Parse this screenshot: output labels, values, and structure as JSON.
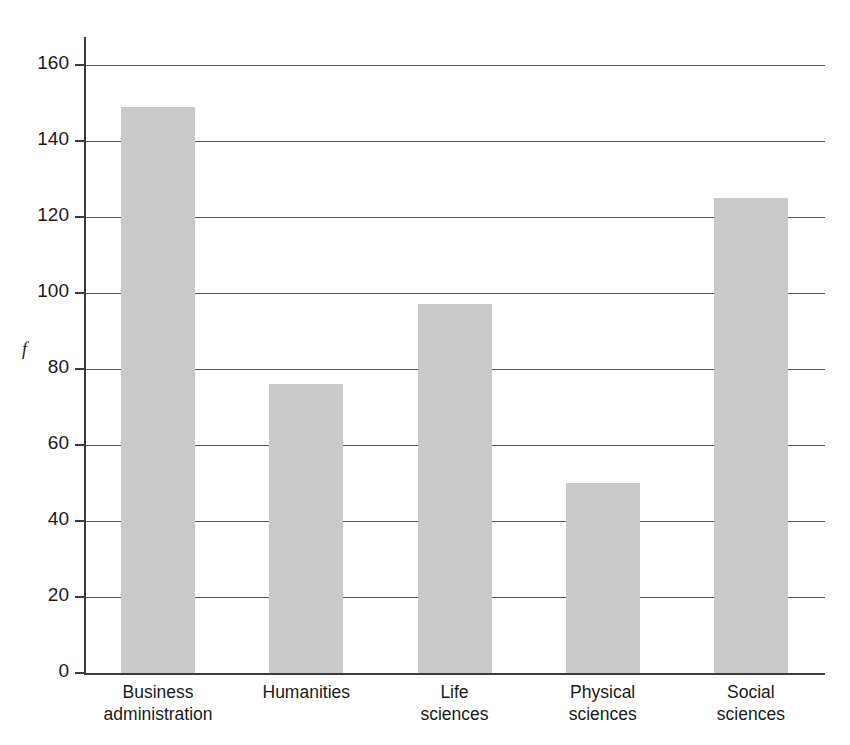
{
  "chart_data": {
    "type": "bar",
    "title": "",
    "xlabel": "",
    "ylabel": "f",
    "categories": [
      "Business\nadministration",
      "Humanities",
      "Life\nsciences",
      "Physical\nsciences",
      "Social\nsciences"
    ],
    "values": [
      149,
      76,
      97,
      50,
      125
    ],
    "ylim": [
      0,
      160
    ],
    "ytick_labels": [
      "0",
      "20",
      "40",
      "60",
      "80",
      "100",
      "120",
      "140",
      "160"
    ],
    "ytick_values": [
      0,
      20,
      40,
      60,
      80,
      100,
      120,
      140,
      160
    ],
    "grid": "horizontal",
    "legend": "none",
    "bar_color": "#c9c9c9",
    "axis_color": "#3b3b3b",
    "gridline_color": "#555555",
    "background_color": "#ffffff"
  }
}
